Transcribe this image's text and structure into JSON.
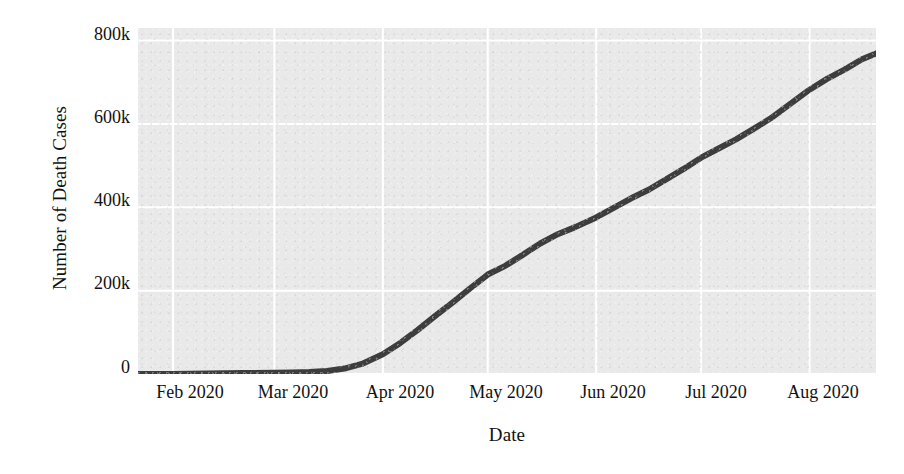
{
  "chart_data": {
    "type": "line",
    "title": "",
    "xlabel": "Date",
    "ylabel": "Number of Death Cases",
    "grid": true,
    "legend": null,
    "style": "seaborn-darkgrid",
    "line_color": "#3d3d3d",
    "panel_color": "#e9e9e9",
    "grid_color": "#ffffff",
    "xlim": [
      "2020-01-22",
      "2020-08-20"
    ],
    "ylim": [
      0,
      830000
    ],
    "ytick_labels": [
      "0",
      "200k",
      "400k",
      "600k",
      "800k"
    ],
    "ytick_values": [
      0,
      200000,
      400000,
      600000,
      800000
    ],
    "xtick_labels": [
      "Feb 2020",
      "Mar 2020",
      "Apr 2020",
      "May 2020",
      "Jun 2020",
      "Jul 2020",
      "Aug 2020"
    ],
    "xtick_values": [
      "2020-02-01",
      "2020-03-01",
      "2020-04-01",
      "2020-05-01",
      "2020-06-01",
      "2020-07-01",
      "2020-08-01"
    ],
    "series": [
      {
        "name": "Cumulative deaths",
        "x": [
          "2020-01-22",
          "2020-02-01",
          "2020-02-11",
          "2020-02-21",
          "2020-03-01",
          "2020-03-06",
          "2020-03-11",
          "2020-03-16",
          "2020-03-21",
          "2020-03-26",
          "2020-04-01",
          "2020-04-06",
          "2020-04-11",
          "2020-04-16",
          "2020-04-21",
          "2020-04-26",
          "2020-05-01",
          "2020-05-06",
          "2020-05-11",
          "2020-05-16",
          "2020-05-21",
          "2020-05-26",
          "2020-06-01",
          "2020-06-06",
          "2020-06-11",
          "2020-06-16",
          "2020-06-21",
          "2020-06-26",
          "2020-07-01",
          "2020-07-06",
          "2020-07-11",
          "2020-07-16",
          "2020-07-21",
          "2020-07-26",
          "2020-08-01",
          "2020-08-06",
          "2020-08-11",
          "2020-08-16",
          "2020-08-20"
        ],
        "y": [
          17,
          259,
          1018,
          2247,
          2996,
          3524,
          4614,
          6973,
          13049,
          24090,
          47192,
          74565,
          105952,
          139378,
          171810,
          205773,
          238619,
          259474,
          285820,
          312990,
          335403,
          352277,
          375637,
          398432,
          421500,
          442000,
          467000,
          492000,
          519000,
          541000,
          563000,
          588000,
          614000,
          645000,
          682000,
          708000,
          730000,
          755000,
          769000
        ]
      }
    ]
  },
  "axes": {
    "ylabel": "Number of Death Cases",
    "xlabel": "Date"
  }
}
